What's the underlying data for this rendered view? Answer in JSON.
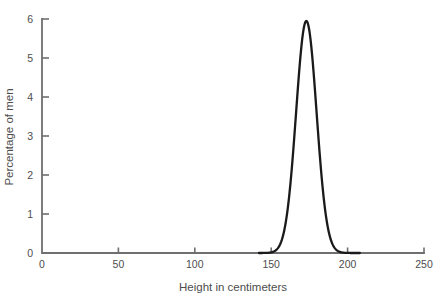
{
  "figure": {
    "background": "#ffffff",
    "axis_color": "#6f6f6f",
    "curve_color": "#1a1a1a",
    "text_color": "#4d4d4d"
  },
  "chart_data": {
    "type": "line",
    "title": "",
    "xlabel": "Height in centimeters",
    "ylabel": "Percentage of men",
    "xlim": [
      0,
      250
    ],
    "ylim": [
      0,
      6
    ],
    "xticks": [
      0,
      50,
      100,
      150,
      200,
      250
    ],
    "yticks": [
      0,
      1,
      2,
      3,
      4,
      5,
      6
    ],
    "grid": false,
    "legend": "none",
    "series": [
      {
        "name": "distribution-of-male-height",
        "curve": "normal",
        "mean_cm": 173,
        "sd_cm": 6.7,
        "peak_percent": 5.95,
        "drawn_range_cm": [
          142,
          208
        ],
        "points": [
          [
            145,
            0.0
          ],
          [
            150,
            0.02
          ],
          [
            155,
            0.16
          ],
          [
            160,
            0.91
          ],
          [
            165,
            2.92
          ],
          [
            170,
            5.38
          ],
          [
            173,
            5.95
          ],
          [
            175,
            5.69
          ],
          [
            180,
            3.45
          ],
          [
            185,
            1.2
          ],
          [
            190,
            0.24
          ],
          [
            195,
            0.03
          ],
          [
            200,
            0.0
          ]
        ]
      }
    ]
  }
}
